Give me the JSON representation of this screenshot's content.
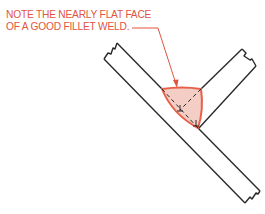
{
  "annotation": {
    "line1": "NOTE THE NEARLY FLAT FACE",
    "line2": "OF A GOOD FILLET WELD."
  },
  "colors": {
    "annotation": "#e0553f",
    "weld_fill": "#f4cdc4",
    "weld_outline": "#e8604a",
    "outline": "#2a2a2a"
  },
  "diagram": {
    "parts": [
      "main-plate",
      "branch-plate",
      "fillet-weld",
      "leader-arrow"
    ]
  }
}
